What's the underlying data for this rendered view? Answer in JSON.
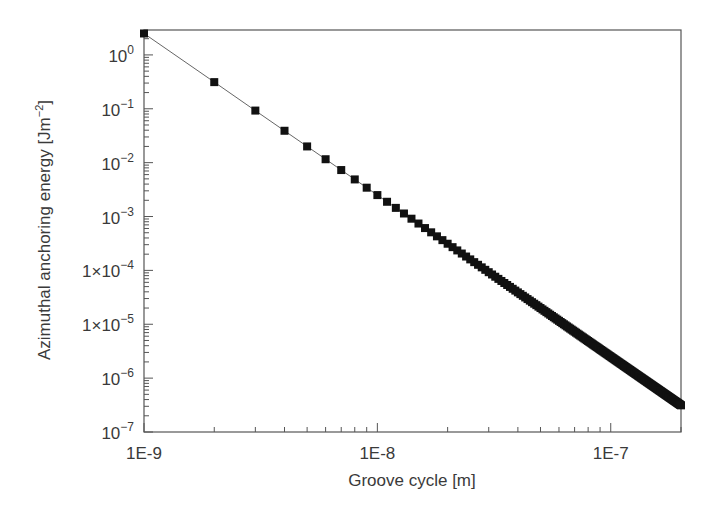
{
  "chart_data": {
    "type": "line",
    "title": "",
    "xlabel": "Groove cycle [m]",
    "ylabel": "Azimuthal anchoring energy [Jm^-2]",
    "xscale": "log",
    "yscale": "log",
    "xlim": [
      1e-09,
      2e-07
    ],
    "ylim": [
      1e-07,
      2.9
    ],
    "x_ticks": [
      {
        "value": 1e-09,
        "label": "1E-9"
      },
      {
        "value": 1e-08,
        "label": "1E-8"
      },
      {
        "value": 1e-07,
        "label": "1E-7"
      }
    ],
    "y_ticks": [
      {
        "value": 1,
        "base": "10",
        "exp": "0",
        "prefix": ""
      },
      {
        "value": 0.1,
        "base": "10",
        "exp": "−1",
        "prefix": ""
      },
      {
        "value": 0.01,
        "base": "10",
        "exp": "−2",
        "prefix": ""
      },
      {
        "value": 0.001,
        "base": "10",
        "exp": "−3",
        "prefix": ""
      },
      {
        "value": 0.0001,
        "base": "10",
        "exp": "−4",
        "prefix": "1×"
      },
      {
        "value": 1e-05,
        "base": "10",
        "exp": "−5",
        "prefix": "1×"
      },
      {
        "value": 1e-06,
        "base": "10",
        "exp": "−6",
        "prefix": ""
      },
      {
        "value": 1e-07,
        "base": "10",
        "exp": "−7",
        "prefix": ""
      }
    ],
    "grid": false,
    "legend": null,
    "marker": "square",
    "series": [
      {
        "name": "Azimuthal anchoring energy",
        "model": "E = 2.5e-27 / d^3",
        "x_step": 1e-09,
        "n_points": 200,
        "sample_points": [
          {
            "x": 1e-09,
            "y": 2.5
          },
          {
            "x": 2e-09,
            "y": 0.3125
          },
          {
            "x": 3e-09,
            "y": 0.0926
          },
          {
            "x": 4e-09,
            "y": 0.0391
          },
          {
            "x": 5e-09,
            "y": 0.02
          },
          {
            "x": 6e-09,
            "y": 0.0116
          },
          {
            "x": 7e-09,
            "y": 0.00729
          },
          {
            "x": 8e-09,
            "y": 0.00488
          },
          {
            "x": 9e-09,
            "y": 0.00343
          },
          {
            "x": 1e-08,
            "y": 0.0025
          },
          {
            "x": 2e-08,
            "y": 0.0003125
          },
          {
            "x": 5e-08,
            "y": 2e-05
          },
          {
            "x": 1e-07,
            "y": 2.5e-06
          },
          {
            "x": 2e-07,
            "y": 3.125e-07
          }
        ]
      }
    ]
  }
}
